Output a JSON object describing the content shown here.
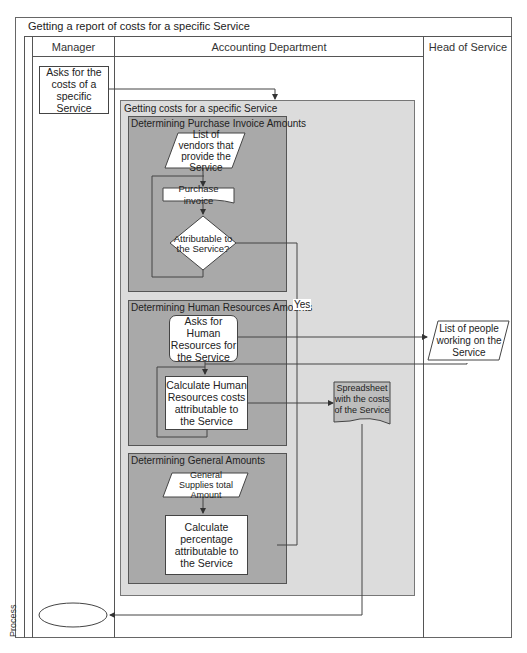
{
  "diagram": {
    "title": "Getting a report of costs for a specific Service",
    "pool_label": "Process",
    "lanes": [
      {
        "name": "Manager"
      },
      {
        "name": "Accounting Department"
      },
      {
        "name": "Head of Service"
      }
    ],
    "subprocess": {
      "title": "Getting costs for a specific Service",
      "groups": [
        {
          "title": "Determining Purchase Invoice Amounts"
        },
        {
          "title": "Determining Human Resources Amounts"
        },
        {
          "title": "Determining General Amounts"
        }
      ]
    },
    "nodes": {
      "ask_costs": "Asks for the costs of a specific Service",
      "list_vendors": "List of vendors that provide the Service",
      "purchase_invoice": "Purchase invoice",
      "attributable": "Attributable to the Service?",
      "ask_hr": "Asks for Human Resources for the Service",
      "list_people": "List of people working on the Service",
      "calc_hr": "Calculate Human Resources costs attributable to the Service",
      "spreadsheet": "Spreadsheet with the costs of the Service",
      "general_supplies": "General Supplies total Amount",
      "calc_pct": "Calculate percentage attributable to the Service",
      "end_terminator": ""
    },
    "edge_labels": {
      "yes": "Yes"
    },
    "colors": {
      "outer_gray": "#dcdcdc",
      "inner_gray": "#a9a9a9",
      "line": "#555555"
    }
  }
}
